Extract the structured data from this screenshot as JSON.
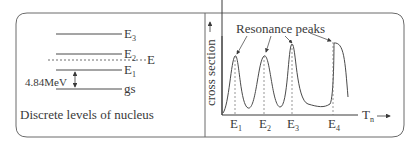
{
  "left_panel": {
    "caption": "Discrete levels of nucleus",
    "levels": [
      {
        "label": "E",
        "sub": "3"
      },
      {
        "label": "E",
        "sub": "2"
      },
      {
        "label": "E",
        "sub": "1"
      },
      {
        "label": "gs",
        "sub": ""
      }
    ],
    "incident_energy_label": "E",
    "gap_label": "4.84MeV"
  },
  "right_panel": {
    "annotation": "Resonance peaks",
    "y_axis_label": "cross section",
    "x_axis_label": "T",
    "x_axis_sub": "n",
    "ticks": [
      {
        "label": "E",
        "sub": "1"
      },
      {
        "label": "E",
        "sub": "2"
      },
      {
        "label": "E",
        "sub": "3"
      },
      {
        "label": "E",
        "sub": "4"
      }
    ]
  },
  "colors": {
    "stroke": "#4a4a4a",
    "text": "#3a3a3a",
    "border": "#6a6a6a"
  }
}
